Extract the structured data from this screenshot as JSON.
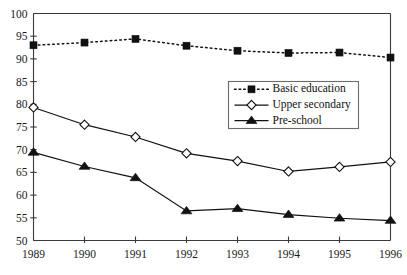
{
  "chart_data": {
    "type": "line",
    "title": "",
    "subtitle": "",
    "xlabel": "",
    "ylabel": "",
    "categories": [
      "1989",
      "1990",
      "1991",
      "1992",
      "1993",
      "1994",
      "1995",
      "1996"
    ],
    "xlim": [
      1989,
      1996
    ],
    "ylim": [
      50,
      100
    ],
    "yticks": [
      50,
      55,
      60,
      65,
      70,
      75,
      80,
      85,
      90,
      95,
      100
    ],
    "ytick_labels": [
      "50",
      "55",
      "60",
      "65",
      "70",
      "75",
      "80",
      "85",
      "90",
      "95",
      "100"
    ],
    "xtick_labels": [
      "1989",
      "1990",
      "1991",
      "1992",
      "1993",
      "1994",
      "1995",
      "1996"
    ],
    "grid": false,
    "legend_position": "upper-right-inside",
    "series": [
      {
        "name": "Basic education",
        "marker": "filled-square",
        "linestyle": "dotted",
        "color": "#111111",
        "values": [
          93.0,
          93.6,
          94.4,
          92.9,
          91.8,
          91.3,
          91.4,
          90.3
        ]
      },
      {
        "name": "Upper secondary",
        "marker": "open-diamond",
        "linestyle": "solid",
        "color": "#111111",
        "values": [
          79.3,
          75.5,
          72.8,
          69.2,
          67.5,
          65.2,
          66.2,
          67.3
        ]
      },
      {
        "name": "Pre-school",
        "marker": "filled-triangle",
        "linestyle": "solid",
        "color": "#111111",
        "values": [
          69.4,
          66.3,
          63.8,
          56.5,
          57.0,
          55.7,
          54.9,
          54.4
        ]
      }
    ]
  },
  "legend": {
    "entries": [
      {
        "label": "Basic education"
      },
      {
        "label": "Upper secondary"
      },
      {
        "label": "Pre-school"
      }
    ]
  },
  "colors": {
    "axis": "#3a3a3a",
    "ink": "#111111",
    "legend_border": "#6b6b6b",
    "background": "#ffffff"
  }
}
